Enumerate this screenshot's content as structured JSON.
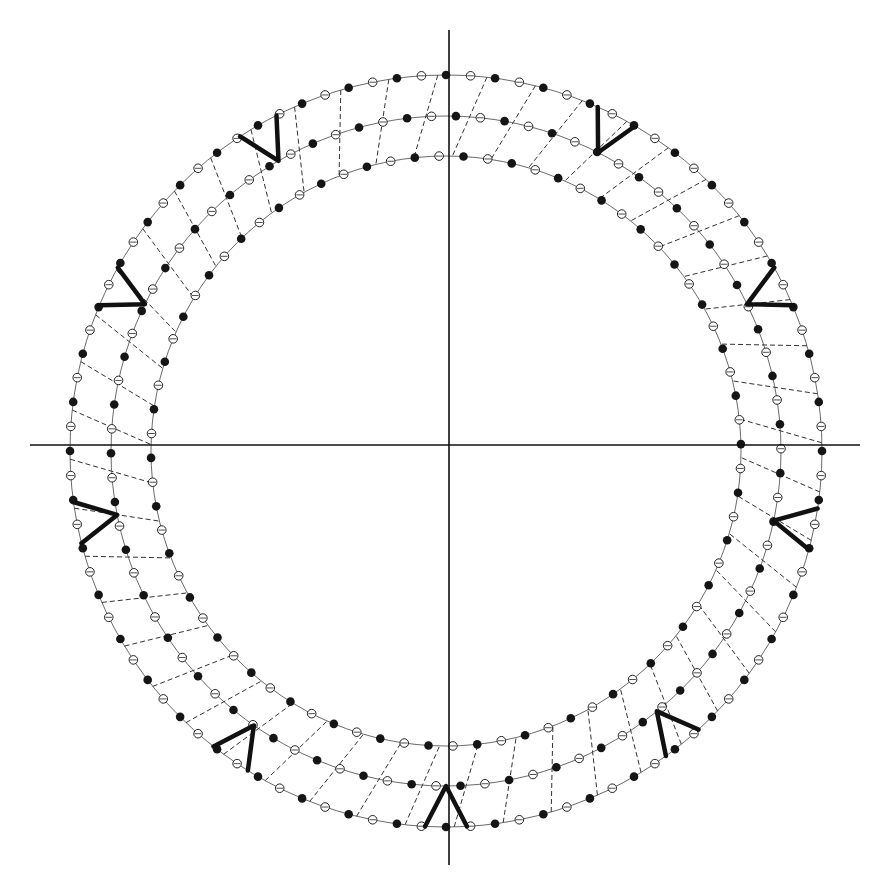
{
  "diagram": {
    "type": "concentric-ring-lattice",
    "canvas": {
      "width": 880,
      "height": 889,
      "background": "#ffffff"
    },
    "center": {
      "x": 446,
      "y": 451
    },
    "axes": {
      "horizontal": {
        "x1": 30,
        "x2": 860,
        "y": 445
      },
      "vertical": {
        "x": 449,
        "y1": 30,
        "y2": 865
      },
      "color": "#111111",
      "width": 1.6
    },
    "rings": [
      {
        "name": "outer",
        "radius": 376,
        "beads": 96,
        "pattern": "alternating"
      },
      {
        "name": "middle",
        "radius": 335,
        "beads": 86,
        "pattern": "alternating"
      },
      {
        "name": "inner",
        "radius": 295,
        "beads": 76,
        "pattern": "alternating"
      }
    ],
    "rungs": {
      "count": 48,
      "style": "dashed",
      "color": "#333333"
    },
    "bead_style": {
      "filled_color": "#151515",
      "open_stroke": "#222222",
      "radius": 4.3
    },
    "v_markers": [
      {
        "angle_deg": -30,
        "label": "V"
      },
      {
        "angle_deg": 27,
        "label": "V"
      },
      {
        "angle_deg": -64,
        "label": "V"
      },
      {
        "angle_deg": 64,
        "label": "V"
      },
      {
        "angle_deg": -101,
        "label": "V"
      },
      {
        "angle_deg": 102,
        "label": "V"
      },
      {
        "angle_deg": -145,
        "label": "V"
      },
      {
        "angle_deg": 141,
        "label": "V"
      },
      {
        "angle_deg": 180,
        "label": "V"
      }
    ],
    "marker_color": "#111111"
  }
}
